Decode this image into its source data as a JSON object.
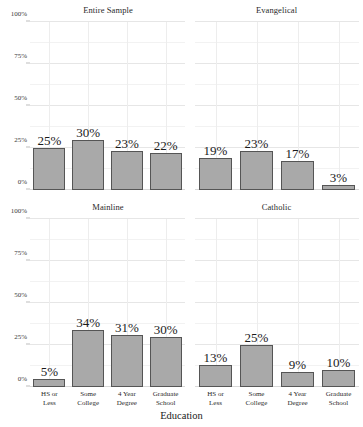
{
  "chart_data": {
    "type": "bar",
    "title": "",
    "xlabel": "Education",
    "ylabel": "",
    "ylim": [
      0,
      100
    ],
    "ytick_labels": [
      "0%",
      "25%",
      "50%",
      "75%",
      "100%"
    ],
    "ytick_values": [
      0,
      25,
      50,
      75,
      100
    ],
    "grid": true,
    "legend": "none",
    "categories": [
      "HS or Less",
      "Some College",
      "4 Year Degree",
      "Graduate School"
    ],
    "category_lines": [
      [
        "HS or",
        "Less"
      ],
      [
        "Some",
        "College"
      ],
      [
        "4 Year",
        "Degree"
      ],
      [
        "Graduate",
        "School"
      ]
    ],
    "facets": [
      {
        "name": "Entire Sample",
        "position": "top-left",
        "values": [
          25,
          30,
          23,
          22
        ],
        "value_labels": [
          "25%",
          "30%",
          "23%",
          "22%"
        ]
      },
      {
        "name": "Evangelical",
        "position": "top-right",
        "values": [
          19,
          23,
          17,
          3
        ],
        "value_labels": [
          "19%",
          "23%",
          "17%",
          "3%"
        ]
      },
      {
        "name": "Mainline",
        "position": "bottom-left",
        "values": [
          5,
          34,
          31,
          30
        ],
        "value_labels": [
          "5%",
          "34%",
          "31%",
          "30%"
        ]
      },
      {
        "name": "Catholic",
        "position": "bottom-right",
        "values": [
          13,
          25,
          9,
          10
        ],
        "value_labels": [
          "13%",
          "25%",
          "9%",
          "10%"
        ]
      }
    ],
    "colors": {
      "bar_fill": "#a9a9a9",
      "bar_border": "#555555",
      "grid_major": "#e6e6e6",
      "grid_minor": "#f2f2f2",
      "text": "#1a1a1a",
      "background": "#ffffff"
    }
  }
}
